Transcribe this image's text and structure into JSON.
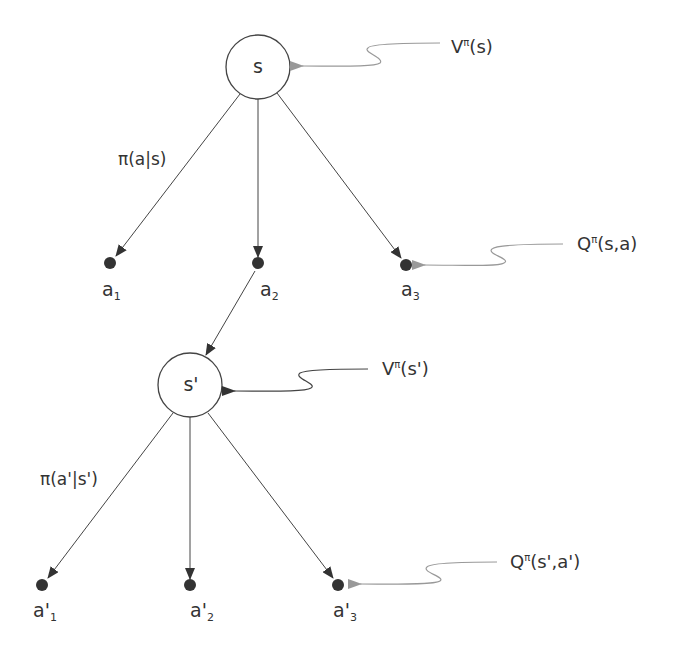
{
  "diagram": {
    "title": "",
    "colors": {
      "line": "#444444",
      "annotation": "#888888",
      "dot": "#333333",
      "text": "#333333"
    },
    "nodes": {
      "s": {
        "label": "s",
        "cx": 258,
        "cy": 67,
        "r": 32
      },
      "s_prime": {
        "label": "s'",
        "cx": 190,
        "cy": 385,
        "r": 32
      }
    },
    "actions_level1": [
      {
        "base": "a",
        "sub": "1",
        "cx": 110,
        "cy": 263
      },
      {
        "base": "a",
        "sub": "2",
        "cx": 258,
        "cy": 263
      },
      {
        "base": "a",
        "sub": "3",
        "cx": 406,
        "cy": 265
      }
    ],
    "actions_level2": [
      {
        "base": "a'",
        "sub": "1",
        "cx": 42,
        "cy": 585
      },
      {
        "base": "a'",
        "sub": "2",
        "cx": 190,
        "cy": 585
      },
      {
        "base": "a'",
        "sub": "3",
        "cx": 338,
        "cy": 585
      }
    ],
    "policy_labels": {
      "level1": "π(a|s)",
      "level2": "π(a'|s')"
    },
    "annotations": {
      "v_s": {
        "base": "V",
        "sup": "π",
        "arg": "(s)"
      },
      "q_sa": {
        "base": "Q",
        "sup": "π",
        "arg": "(s,a)"
      },
      "v_s_prime": {
        "base": "V",
        "sup": "π",
        "arg": "(s')"
      },
      "q_s_prime_a_prime": {
        "base": "Q",
        "sup": "π",
        "arg": "(s',a')"
      }
    }
  }
}
